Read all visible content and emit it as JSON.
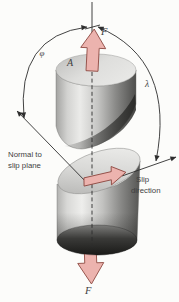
{
  "figure_description": "Single-crystal cylinder under tensile force F showing slip plane geometry with angles phi and lambda",
  "colors": {
    "background": "#fcfcfa",
    "line": "#2e2e2e",
    "text": "#3f3f3f",
    "arrow_fill": "#ecb3ae",
    "arrow_stroke": "#8f4b43"
  },
  "labels": {
    "force_top": "F",
    "cross_section_area": "A",
    "phi": "φ",
    "lambda": "λ",
    "normal_to_slip_plane": {
      "line1": "Normal to",
      "line2": "slip plane"
    },
    "slip_direction": {
      "line1": "Slip",
      "line2": "direction"
    },
    "force_bottom": "F"
  }
}
